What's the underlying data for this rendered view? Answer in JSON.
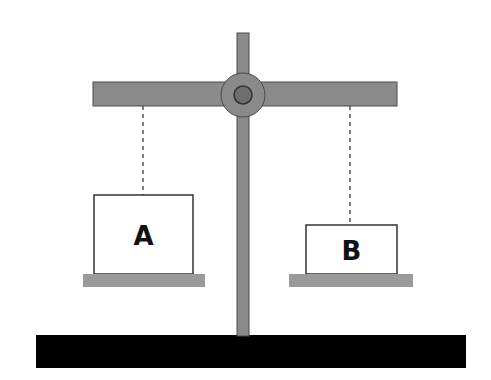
{
  "diagram": {
    "type": "balance-scale",
    "colors": {
      "beam": "#8a8a8a",
      "beam_stroke": "#4a4a4a",
      "pivot": "#6e6e6e",
      "base": "#000000",
      "pan": "#9a9a9a",
      "box_fill": "#ffffff",
      "box_stroke": "#333333",
      "string": "#555555"
    },
    "left_object": {
      "label": "A"
    },
    "right_object": {
      "label": "B"
    }
  }
}
